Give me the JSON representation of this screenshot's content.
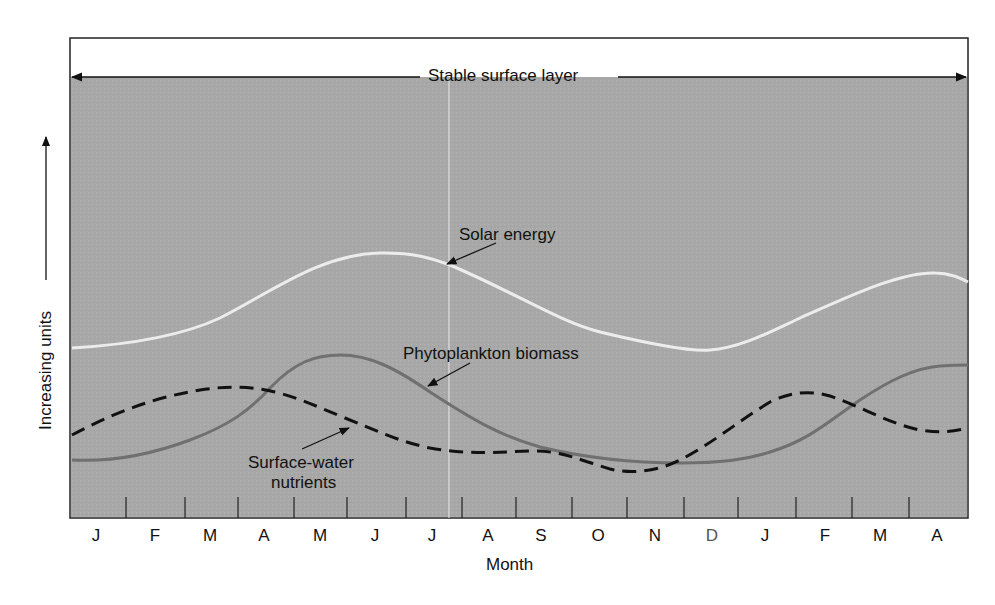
{
  "chart_data": {
    "type": "line",
    "title": "",
    "xlabel": "Month",
    "ylabel": "Increasing units",
    "y_axis_arrow": true,
    "grid": false,
    "categories": [
      "J",
      "F",
      "M",
      "A",
      "M",
      "J",
      "J",
      "A",
      "S",
      "O",
      "N",
      "D",
      "J",
      "F",
      "M",
      "A"
    ],
    "annotations": {
      "band": "Stable surface layer",
      "solar": "Solar energy",
      "phyto": "Phytoplankton biomass",
      "nutrients_line1": "Surface-water",
      "nutrients_line2": "nutrients"
    },
    "series": [
      {
        "name": "Solar energy",
        "style": "solid-light",
        "color": "#e6e6e6",
        "values": [
          2.4,
          2.5,
          2.8,
          3.3,
          3.8,
          4.1,
          3.8,
          3.3,
          2.8,
          2.5,
          2.3,
          2.3,
          2.6,
          3.0,
          3.5,
          3.7
        ]
      },
      {
        "name": "Phytoplankton biomass",
        "style": "solid-dark",
        "color": "#6e6e6e",
        "values": [
          0.8,
          0.9,
          1.3,
          1.9,
          2.7,
          2.5,
          2.0,
          1.5,
          1.1,
          0.9,
          0.8,
          0.8,
          0.9,
          1.3,
          2.0,
          2.3
        ]
      },
      {
        "name": "Surface-water nutrients",
        "style": "dashed",
        "color": "#111111",
        "values": [
          1.5,
          1.9,
          2.1,
          2.0,
          1.7,
          1.3,
          1.1,
          1.0,
          1.0,
          0.8,
          0.7,
          1.2,
          1.9,
          2.0,
          1.6,
          1.4
        ]
      }
    ],
    "ylim": [
      0,
      5
    ]
  },
  "layout": {
    "frame": {
      "x1": 70,
      "y1": 38,
      "x2": 968,
      "y2": 518
    },
    "gray_top": 77,
    "tick_x": [
      126,
      185,
      238,
      294,
      347,
      406,
      462,
      516,
      572,
      627,
      684,
      738,
      796,
      852,
      909
    ],
    "tick_label_x": [
      96,
      155,
      210,
      264,
      320,
      375,
      432,
      488,
      541,
      598,
      655,
      712,
      765,
      825,
      880,
      937
    ],
    "bg_color": "#a9a9a9",
    "paths": {
      "solar": "M72,348 C140,344 190,332 220,318 C270,293 320,254 380,253 C420,252 440,262 450,265 C520,295 560,322 600,332 C650,344 690,352 710,350 C740,348 770,332 800,318 C850,296 900,272 935,273 C950,273 960,278 968,282",
      "phyto": "M72,460 C110,462 150,455 190,440 C230,425 250,410 270,388 C295,362 315,355 340,355 C370,355 395,368 430,392 C470,418 500,436 540,447 C590,459 640,463 680,463 C720,463 745,460 770,452 C810,440 830,420 860,400 C890,380 915,368 940,366 C955,365 962,365 968,365",
      "nutrients": "M72,435 C110,415 150,398 200,390 C225,386 250,386 275,392 C300,398 320,408 345,418 C375,430 400,442 430,448 C470,455 500,452 530,451 C560,450 580,460 610,469 C635,475 660,470 680,460 C710,445 740,420 770,402 C790,392 810,390 830,396 C860,406 890,424 920,430 C945,434 958,430 968,428"
    }
  }
}
